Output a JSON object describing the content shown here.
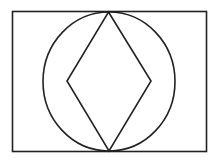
{
  "diagram": {
    "stroke_color": "#222222",
    "fill_color": "#ffffff",
    "shapes": {
      "rectangle": {
        "x": 12.5,
        "y": 11.5,
        "width": 194,
        "height": 140
      },
      "circle": {
        "cx": 109,
        "cy": 81.5,
        "rx": 66,
        "ry": 69.5
      },
      "rhombus": {
        "points": [
          {
            "name": "top",
            "x": 108.5,
            "y": 12
          },
          {
            "name": "right",
            "x": 151,
            "y": 81
          },
          {
            "name": "bottom",
            "x": 109,
            "y": 151
          },
          {
            "name": "left",
            "x": 67,
            "y": 81
          }
        ]
      }
    }
  }
}
